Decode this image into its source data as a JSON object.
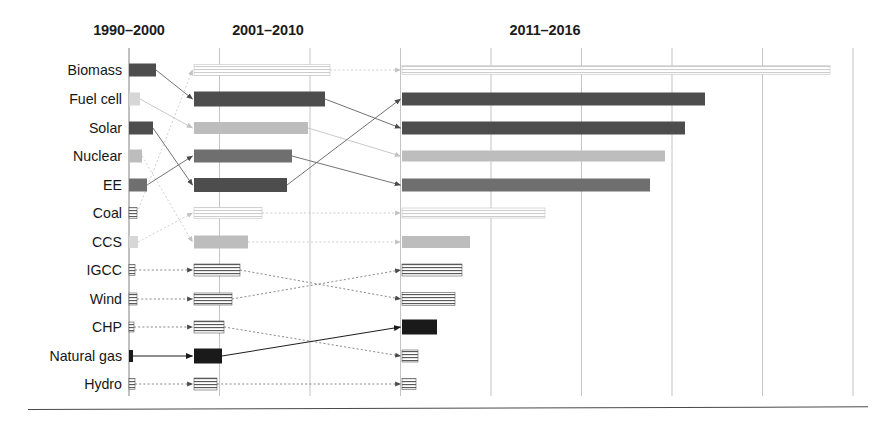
{
  "figure": {
    "title": "",
    "axis_label": ""
  },
  "chart_data": {
    "type": "bar",
    "title": "",
    "subtitle": "",
    "xlabel": "",
    "ylabel": "",
    "orientation": "horizontal",
    "grid": true,
    "legend": "none",
    "annotations": "Arrows connect each technology between consecutive time periods to show rank change.",
    "axis": {
      "x_start_px": 129,
      "gridline_spacing_px": 90.5,
      "gridline_count": 9,
      "gridline_positions_px": [
        129,
        219.5,
        310,
        400.5,
        491,
        581.5,
        672,
        762.5,
        853
      ],
      "xlim_units": [
        0,
        8
      ],
      "tick_labels_shown": false
    },
    "categories": [
      "Biomass",
      "Fuel cell",
      "Solar",
      "Nuclear",
      "EE",
      "Coal",
      "CCS",
      "IGCC",
      "Wind",
      "CHP",
      "Natural gas",
      "Hydro"
    ],
    "series": [
      {
        "name": "1990-2000",
        "values": [
          0.3,
          0.12,
          0.26,
          0.14,
          0.2,
          0.09,
          0.1,
          0.07,
          0.09,
          0.05,
          0.04,
          0.06
        ]
      },
      {
        "name": "2001-2010",
        "values": [
          1.5,
          1.45,
          1.26,
          1.08,
          1.03,
          0.75,
          0.6,
          0.51,
          0.42,
          0.33,
          0.31,
          0.25
        ]
      },
      {
        "name": "2011-2016",
        "values": [
          4.73,
          3.35,
          3.13,
          2.91,
          2.74,
          1.58,
          0.75,
          0.66,
          0.59,
          0.39,
          0.18,
          0.15
        ]
      }
    ]
  },
  "headers": [
    {
      "id": "period-1",
      "label": "1990–2000",
      "center_px": 129
    },
    {
      "id": "period-2",
      "label": "2001–2010",
      "center_px": 268
    },
    {
      "id": "period-3",
      "label": "2011–2016",
      "center_px": 545
    }
  ],
  "rows": [
    {
      "label": "Biomass",
      "y": 70,
      "tone1": "dark",
      "tone2": "hatch-pale",
      "tone3": "hatch-pale"
    },
    {
      "label": "Fuel cell",
      "y": 99,
      "tone1": "pale",
      "tone2": "dark",
      "tone3": "dark"
    },
    {
      "label": "Solar",
      "y": 128,
      "tone1": "dark",
      "tone2": "light",
      "tone3": "dark"
    },
    {
      "label": "Nuclear",
      "y": 156,
      "tone1": "light",
      "tone2": "mid",
      "tone3": "light"
    },
    {
      "label": "EE",
      "y": 185,
      "tone1": "mid",
      "tone2": "dark",
      "tone3": "mid"
    },
    {
      "label": "Coal",
      "y": 213,
      "tone1": "hatch",
      "tone2": "hatch-pale",
      "tone3": "hatch-pale"
    },
    {
      "label": "CCS",
      "y": 242,
      "tone1": "pale",
      "tone2": "light",
      "tone3": "light"
    },
    {
      "label": "IGCC",
      "y": 270,
      "tone1": "hatch",
      "tone2": "hatch",
      "tone3": "hatch"
    },
    {
      "label": "Wind",
      "y": 299,
      "tone1": "hatch",
      "tone2": "hatch",
      "tone3": "hatch"
    },
    {
      "label": "CHP",
      "y": 327,
      "tone1": "hatch",
      "tone2": "hatch",
      "tone3": "black"
    },
    {
      "label": "Natural gas",
      "y": 356,
      "tone1": "tick",
      "tone2": "black",
      "tone3": "hatch"
    },
    {
      "label": "Hydro",
      "y": 384,
      "tone1": "hatch",
      "tone2": "hatch",
      "tone3": "hatch"
    }
  ],
  "bars": {
    "col1_x": 129,
    "col2_x": 194,
    "col3_x": 402,
    "col1": [
      {
        "row": "Biomass",
        "x": 129,
        "w": 27,
        "h": 13
      },
      {
        "row": "Fuel cell",
        "x": 129,
        "w": 11,
        "h": 13
      },
      {
        "row": "Solar",
        "x": 129,
        "w": 24,
        "h": 13
      },
      {
        "row": "Nuclear",
        "x": 129,
        "w": 13,
        "h": 13
      },
      {
        "row": "EE",
        "x": 129,
        "w": 18,
        "h": 13
      },
      {
        "row": "Coal",
        "x": 129,
        "w": 8,
        "h": 11
      },
      {
        "row": "CCS",
        "x": 129,
        "w": 9,
        "h": 12
      },
      {
        "row": "IGCC",
        "x": 129,
        "w": 6,
        "h": 11
      },
      {
        "row": "Wind",
        "x": 129,
        "w": 8,
        "h": 12
      },
      {
        "row": "CHP",
        "x": 129,
        "w": 5,
        "h": 10
      },
      {
        "row": "Natural gas",
        "x": 129,
        "w": 4,
        "h": 12
      },
      {
        "row": "Hydro",
        "x": 129,
        "w": 6,
        "h": 11
      }
    ],
    "col2": [
      {
        "row": "Biomass",
        "x": 194,
        "w": 136,
        "h": 11
      },
      {
        "row": "Fuel cell",
        "x": 194,
        "w": 131,
        "h": 15
      },
      {
        "row": "Solar",
        "x": 194,
        "w": 114,
        "h": 12
      },
      {
        "row": "Nuclear",
        "x": 194,
        "w": 98,
        "h": 13
      },
      {
        "row": "EE",
        "x": 194,
        "w": 93,
        "h": 14
      },
      {
        "row": "Coal",
        "x": 194,
        "w": 68,
        "h": 11
      },
      {
        "row": "CCS",
        "x": 194,
        "w": 54,
        "h": 13
      },
      {
        "row": "IGCC",
        "x": 194,
        "w": 46,
        "h": 12
      },
      {
        "row": "Wind",
        "x": 194,
        "w": 38,
        "h": 12
      },
      {
        "row": "CHP",
        "x": 194,
        "w": 30,
        "h": 12
      },
      {
        "row": "Natural gas",
        "x": 194,
        "w": 28,
        "h": 15
      },
      {
        "row": "Hydro",
        "x": 194,
        "w": 23,
        "h": 12
      }
    ],
    "col3": [
      {
        "row": "Biomass",
        "x": 402,
        "w": 428,
        "h": 9
      },
      {
        "row": "Fuel cell",
        "x": 402,
        "w": 303,
        "h": 13
      },
      {
        "row": "Solar",
        "x": 402,
        "w": 283,
        "h": 13
      },
      {
        "row": "Nuclear",
        "x": 402,
        "w": 263,
        "h": 11
      },
      {
        "row": "EE",
        "x": 402,
        "w": 248,
        "h": 13
      },
      {
        "row": "Coal",
        "x": 402,
        "w": 143,
        "h": 10
      },
      {
        "row": "CCS",
        "x": 402,
        "w": 68,
        "h": 12
      },
      {
        "row": "IGCC",
        "x": 402,
        "w": 60,
        "h": 12
      },
      {
        "row": "Wind",
        "x": 402,
        "w": 53,
        "h": 13
      },
      {
        "row": "CHP",
        "x": 402,
        "w": 35,
        "h": 15
      },
      {
        "row": "Natural gas",
        "x": 402,
        "w": 16,
        "h": 12
      },
      {
        "row": "Hydro",
        "x": 402,
        "w": 14,
        "h": 11
      }
    ]
  },
  "connectors": {
    "stage_a": [
      {
        "from": "Biomass",
        "to": "Fuel cell",
        "style": "solid"
      },
      {
        "from": "Fuel cell",
        "to": "Solar",
        "style": "solid-pale"
      },
      {
        "from": "Solar",
        "to": "EE",
        "style": "solid"
      },
      {
        "from": "Nuclear",
        "to": "CCS",
        "style": "dotted-pale"
      },
      {
        "from": "EE",
        "to": "Nuclear",
        "style": "solid"
      },
      {
        "from": "Coal",
        "to": "Biomass",
        "style": "dotted-pale"
      },
      {
        "from": "CCS",
        "to": "Coal",
        "style": "dotted-pale"
      },
      {
        "from": "IGCC",
        "to": "IGCC",
        "style": "dotted"
      },
      {
        "from": "Wind",
        "to": "Wind",
        "style": "dotted"
      },
      {
        "from": "CHP",
        "to": "CHP",
        "style": "dotted"
      },
      {
        "from": "Natural gas",
        "to": "Natural gas",
        "style": "solid-black"
      },
      {
        "from": "Hydro",
        "to": "Hydro",
        "style": "dotted"
      }
    ],
    "stage_b": [
      {
        "from": "Biomass",
        "to": "Biomass",
        "style": "dotted-pale"
      },
      {
        "from": "Fuel cell",
        "to": "Solar",
        "style": "solid"
      },
      {
        "from": "Solar",
        "to": "Nuclear",
        "style": "solid-pale"
      },
      {
        "from": "Nuclear",
        "to": "EE",
        "style": "solid"
      },
      {
        "from": "EE",
        "to": "Fuel cell",
        "style": "solid"
      },
      {
        "from": "Coal",
        "to": "Coal",
        "style": "dotted-pale"
      },
      {
        "from": "CCS",
        "to": "CCS",
        "style": "dotted-pale"
      },
      {
        "from": "IGCC",
        "to": "Wind",
        "style": "dotted"
      },
      {
        "from": "Wind",
        "to": "IGCC",
        "style": "dotted"
      },
      {
        "from": "CHP",
        "to": "Natural gas",
        "style": "dotted"
      },
      {
        "from": "Natural gas",
        "to": "CHP",
        "style": "solid-black"
      },
      {
        "from": "Hydro",
        "to": "Hydro",
        "style": "dotted"
      }
    ]
  },
  "palette": {
    "dark": "#4d4d4d",
    "mid": "#6f6f6f",
    "light": "#bdbdbd",
    "pale": "#d6d6d6",
    "black": "#1a1a1a",
    "hatch_stroke": "#5a5a5a",
    "hatch_pale_stroke": "#c4c4c4",
    "gridline": "#b9b9b9",
    "axis": "#8c8c8c",
    "baseline": "#4a4a4a",
    "text": "#161616"
  }
}
